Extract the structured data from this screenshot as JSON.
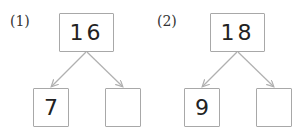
{
  "problems": [
    {
      "label": "(1)",
      "total": "16",
      "left_part": "7",
      "right_part": ""
    },
    {
      "label": "(2)",
      "total": "18",
      "left_part": "9",
      "right_part": ""
    }
  ],
  "colors": {
    "box_border": "#a8a8a8",
    "arrow": "#b0b0b0",
    "text": "#222222"
  }
}
